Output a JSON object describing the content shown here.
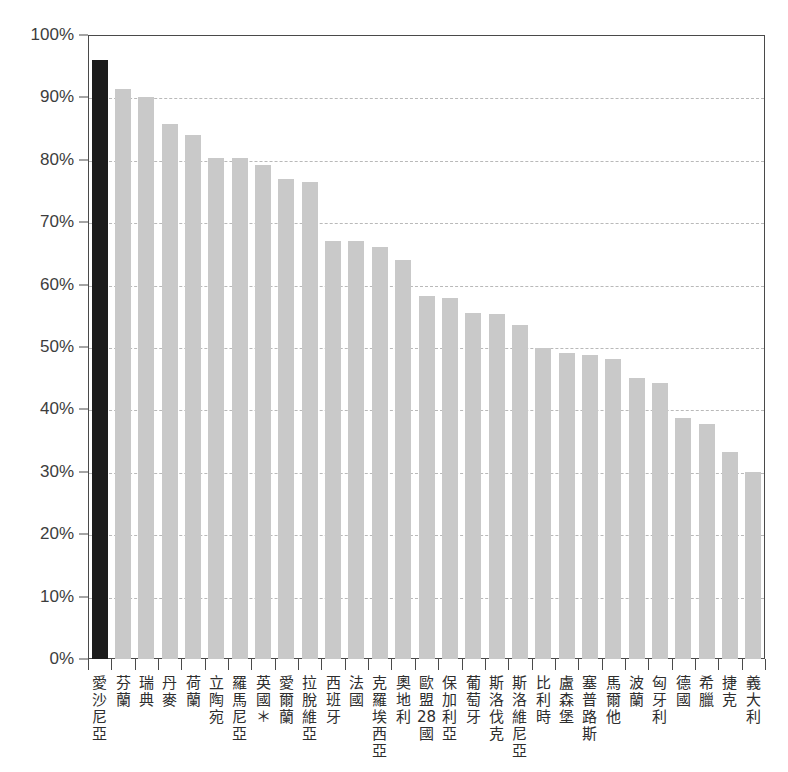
{
  "chart": {
    "title": "",
    "y_axis_ticks": [
      "0%",
      "10%",
      "20%",
      "30%",
      "40%",
      "50%",
      "60%",
      "70%",
      "80%",
      "90%",
      "100%"
    ]
  },
  "chart_data": {
    "type": "bar",
    "title": "",
    "xlabel": "",
    "ylabel": "",
    "ylim": [
      0,
      100
    ],
    "grid": true,
    "legend": "none",
    "highlight_index": 0,
    "highlight_color": "#1c1c1c",
    "bar_color": "#c9c9c9",
    "categories": [
      "愛沙尼亞",
      "芬蘭",
      "瑞典",
      "丹麥",
      "荷蘭",
      "立陶宛",
      "羅馬尼亞",
      "英國＊",
      "愛爾蘭",
      "拉脫維亞",
      "西班牙",
      "法國",
      "克羅埃西亞",
      "奧地利",
      "歐盟28國",
      "保加利亞",
      "葡萄牙",
      "斯洛伐克",
      "斯洛維尼亞",
      "比利時",
      "盧森堡",
      "塞普路斯",
      "馬爾他",
      "波蘭",
      "匈牙利",
      "德國",
      "希臘",
      "捷克",
      "義大利"
    ],
    "values": [
      96.0,
      91.3,
      90.0,
      85.8,
      84.0,
      80.3,
      80.3,
      79.2,
      77.0,
      76.4,
      67.0,
      67.0,
      66.0,
      64.0,
      58.2,
      57.9,
      55.5,
      55.3,
      53.5,
      49.8,
      49.0,
      48.7,
      48.0,
      45.0,
      44.3,
      38.6,
      37.6,
      33.2,
      30.0
    ],
    "value_suffix": "%"
  }
}
